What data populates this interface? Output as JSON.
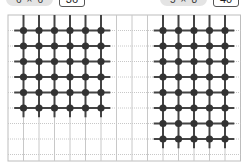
{
  "panels": [
    {
      "id": "left",
      "dims_label_cols": "6",
      "dims_label_sep": "×",
      "dims_label_rows": "6",
      "value": "36",
      "node_cols": 6,
      "node_rows": 6,
      "start_col": 1,
      "start_row": 1
    },
    {
      "id": "right",
      "dims_label_cols": "5",
      "dims_label_sep": "×",
      "dims_label_rows": "8",
      "value": "40",
      "node_cols": 5,
      "node_rows": 8,
      "start_col": 10,
      "start_row": 1
    }
  ],
  "grid": {
    "origin_x": 8,
    "origin_y": 15,
    "cell": 15.5,
    "cols": 15,
    "rows": 9.4,
    "line_color": "#c8c8c8",
    "node_color": "#333333",
    "wire_color": "#444444"
  }
}
